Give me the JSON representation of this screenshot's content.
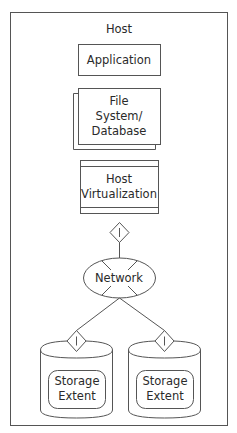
{
  "diagram": {
    "container": {
      "label": "Host"
    },
    "nodes": {
      "application": {
        "label": "Application",
        "shape": "rectangle"
      },
      "file_system": {
        "line1": "File",
        "line2": "System/",
        "line3": "Database",
        "shape": "stacked-rectangle"
      },
      "host_virtualization": {
        "line1": "Host",
        "line2": "Virtualization",
        "shape": "rectangle-with-bars"
      },
      "network": {
        "label": "Network",
        "shape": "ellipse-with-cross"
      },
      "storage_left": {
        "line1": "Storage",
        "line2": "Extent",
        "shape": "cylinder-with-rounded-rect"
      },
      "storage_right": {
        "line1": "Storage",
        "line2": "Extent",
        "shape": "cylinder-with-rounded-rect"
      }
    },
    "connectors": [
      {
        "from": "host_virtualization",
        "to": "network",
        "marker": "diamond-I"
      },
      {
        "from": "network",
        "to": "storage_left",
        "marker": "diamond-I"
      },
      {
        "from": "network",
        "to": "storage_right",
        "marker": "diamond-I"
      }
    ],
    "markers": {
      "diamond_symbol": "I"
    },
    "colors": {
      "stroke": "#555555",
      "text": "#2a2a2a",
      "background": "#ffffff"
    }
  }
}
